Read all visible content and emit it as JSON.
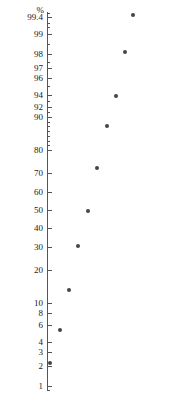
{
  "figure": {
    "name": "normal-probability-plot",
    "width": 169,
    "height": 394,
    "background": "#ffffff",
    "point_color": "#454545",
    "axis_color": "#555555",
    "text_color": "#1a1a1a"
  },
  "axis": {
    "unit_label": "%",
    "unit_label_x": 44,
    "unit_label_y": 6,
    "spine_x": 47,
    "spine_top": 12,
    "spine_bottom": 390,
    "tick_length": 5,
    "tick_label_right": 43,
    "major_ticks": [
      {
        "label": "99.4",
        "y": 17
      },
      {
        "label": "99",
        "y": 34
      },
      {
        "label": "98",
        "y": 54
      },
      {
        "label": "97",
        "y": 68
      },
      {
        "label": "96",
        "y": 78
      },
      {
        "label": "94",
        "y": 95
      },
      {
        "label": "92",
        "y": 107
      },
      {
        "label": "90",
        "y": 117
      },
      {
        "label": "80",
        "y": 150
      },
      {
        "label": "70",
        "y": 173
      },
      {
        "label": "60",
        "y": 192
      },
      {
        "label": "50",
        "y": 210
      },
      {
        "label": "40",
        "y": 228
      },
      {
        "label": "30",
        "y": 247
      },
      {
        "label": "20",
        "y": 270
      },
      {
        "label": "10",
        "y": 303
      },
      {
        "label": "8",
        "y": 313
      },
      {
        "label": "6",
        "y": 325
      },
      {
        "label": "4",
        "y": 342
      },
      {
        "label": "3",
        "y": 352
      },
      {
        "label": "2",
        "y": 366
      },
      {
        "label": "1",
        "y": 386
      }
    ],
    "minor_ticks": [
      {
        "y": 13
      },
      {
        "y": 23
      },
      {
        "y": 27
      },
      {
        "y": 44
      },
      {
        "y": 62
      },
      {
        "y": 86
      },
      {
        "y": 101
      },
      {
        "y": 112
      },
      {
        "y": 122
      },
      {
        "y": 126
      },
      {
        "y": 131
      },
      {
        "y": 136
      },
      {
        "y": 141
      },
      {
        "y": 145
      },
      {
        "y": 390
      }
    ]
  },
  "chart_data": {
    "type": "scatter",
    "title": "",
    "xlabel": "",
    "ylabel": "%",
    "yscale": "probability",
    "grid": false,
    "legend": null,
    "y_tick_labels": [
      "99.4",
      "99",
      "98",
      "97",
      "96",
      "94",
      "92",
      "90",
      "80",
      "70",
      "60",
      "50",
      "40",
      "30",
      "20",
      "10",
      "8",
      "6",
      "4",
      "3",
      "2",
      "1"
    ],
    "ylim": [
      0.6,
      99.7
    ],
    "marker": "filled-circle",
    "marker_size": 4,
    "points": [
      {
        "px": 133,
        "py": 15,
        "value": 99.5
      },
      {
        "px": 125,
        "py": 52,
        "value": 98.0
      },
      {
        "px": 116,
        "py": 96,
        "value": 93.5
      },
      {
        "px": 107,
        "py": 126,
        "value": 84.0
      },
      {
        "px": 97,
        "py": 168,
        "value": 70.0
      },
      {
        "px": 88,
        "py": 211,
        "value": 50.0
      },
      {
        "px": 78,
        "py": 246,
        "value": 31.0
      },
      {
        "px": 69,
        "py": 290,
        "value": 17.0
      },
      {
        "px": 60,
        "py": 330,
        "value": 6.2
      },
      {
        "px": 50,
        "py": 363,
        "value": 2.0
      }
    ],
    "values": [
      99.5,
      98.0,
      93.5,
      84.0,
      70.0,
      50.0,
      31.0,
      17.0,
      6.2,
      2.0
    ]
  }
}
